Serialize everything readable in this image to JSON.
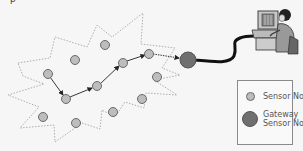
{
  "diagram": {
    "type": "wireless sensor network",
    "cut_off_text": "p",
    "colors": {
      "background": "#f6f6f6",
      "sensor_node_fill": "#bdbdbd",
      "sensor_node_stroke": "#6a6a6a",
      "gateway_fill": "#6f6f6f",
      "cloud_outline": "#9a9a9a",
      "path_arrow": "#222222",
      "cable": "#111111"
    },
    "sensor_nodes": [
      {
        "id": "n1",
        "x": 48,
        "y": 74
      },
      {
        "id": "n2",
        "x": 75,
        "y": 60
      },
      {
        "id": "n3",
        "x": 105,
        "y": 45
      },
      {
        "id": "n4",
        "x": 66,
        "y": 99
      },
      {
        "id": "n5",
        "x": 97,
        "y": 86
      },
      {
        "id": "n6",
        "x": 123,
        "y": 63
      },
      {
        "id": "n7",
        "x": 149,
        "y": 54
      },
      {
        "id": "n8",
        "x": 157,
        "y": 77
      },
      {
        "id": "n9",
        "x": 43,
        "y": 117
      },
      {
        "id": "n10",
        "x": 76,
        "y": 123
      },
      {
        "id": "n11",
        "x": 113,
        "y": 112
      },
      {
        "id": "n12",
        "x": 142,
        "y": 99
      }
    ],
    "gateway_node": {
      "x": 188,
      "y": 60
    },
    "routing_path": [
      "n1",
      "n4",
      "n5",
      "n6",
      "n7",
      "gateway"
    ],
    "workstation": {
      "label": "user at computer terminal"
    }
  },
  "legend": {
    "items": [
      {
        "label_line1": "Sensor Node",
        "label_line2": ""
      },
      {
        "label_line1": "Gateway",
        "label_line2": "Sensor Node"
      }
    ]
  }
}
